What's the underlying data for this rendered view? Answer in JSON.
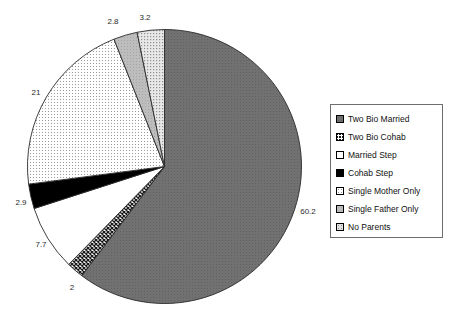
{
  "chart_data": {
    "type": "pie",
    "title": "",
    "xlabel": "",
    "ylabel": "",
    "legend_position": "right",
    "grid": false,
    "start_angle_deg": 0,
    "direction": "clockwise",
    "categories": [
      "Two Bio Married",
      "Two Bio Cohab",
      "Married Step",
      "Cohab Step",
      "Single Mother Only",
      "Single Father Only",
      "No Parents"
    ],
    "values": [
      60.2,
      2,
      7.7,
      2.9,
      21,
      2.8,
      3.2
    ],
    "data_labels": [
      "60.2",
      "2",
      "7.7",
      "2.9",
      "21",
      "2.8",
      "3.2"
    ],
    "slices": [
      {
        "label": "Two Bio Married",
        "value": 60.2,
        "data_label": "60.2",
        "pattern": "solid-dark-gray",
        "fill": "#6b6b6b",
        "label_x": 308,
        "label_y": 214
      },
      {
        "label": "Two Bio Cohab",
        "value": 2,
        "data_label": "2",
        "pattern": "cross-hatch",
        "fill": "#3a3a3a",
        "label_x": 72,
        "label_y": 290
      },
      {
        "label": "Married Step",
        "value": 7.7,
        "data_label": "7.7",
        "pattern": "white",
        "fill": "#ffffff",
        "label_x": 41,
        "label_y": 247
      },
      {
        "label": "Cohab Step",
        "value": 2.9,
        "data_label": "2.9",
        "pattern": "solid-black",
        "fill": "#000000",
        "label_x": 21,
        "label_y": 205
      },
      {
        "label": "Single Mother Only",
        "value": 21,
        "data_label": "21",
        "pattern": "light-dots",
        "fill": "#f0f0f0",
        "label_x": 36,
        "label_y": 95
      },
      {
        "label": "Single Father Only",
        "value": 2.8,
        "data_label": "2.8",
        "pattern": "medium-gray",
        "fill": "#b8b8b8",
        "label_x": 113,
        "label_y": 24
      },
      {
        "label": "No Parents",
        "value": 3.2,
        "data_label": "3.2",
        "pattern": "light-dots-gray",
        "fill": "#dcdcdc",
        "label_x": 145,
        "label_y": 20
      }
    ],
    "geometry": {
      "cx": 164.5,
      "cy": 166.5,
      "r": 137
    }
  },
  "legend": {
    "items": [
      {
        "label": "Two Bio Married",
        "swatch": "solid-dark-gray"
      },
      {
        "label": "Two Bio Cohab",
        "swatch": "cross-hatch"
      },
      {
        "label": "Married Step",
        "swatch": "white"
      },
      {
        "label": "Cohab Step",
        "swatch": "solid-black"
      },
      {
        "label": "Single Mother Only",
        "swatch": "light-dots"
      },
      {
        "label": "Single Father Only",
        "swatch": "medium-gray"
      },
      {
        "label": "No Parents",
        "swatch": "light-dots-gray"
      }
    ]
  }
}
